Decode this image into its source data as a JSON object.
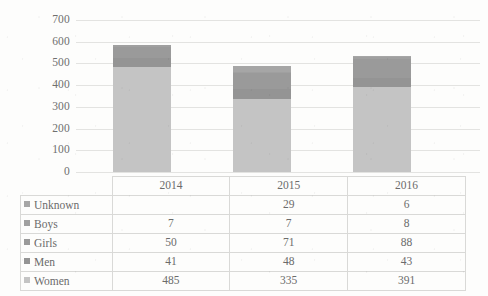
{
  "chart_data": {
    "type": "bar",
    "subtype": "stacked-column",
    "title": "",
    "xlabel": "",
    "ylabel": "",
    "categories": [
      "2014",
      "2015",
      "2016"
    ],
    "series": [
      {
        "name": "Unknown",
        "values": [
          null,
          29,
          6
        ],
        "color": "#a6a6a6"
      },
      {
        "name": "Boys",
        "values": [
          7,
          7,
          8
        ],
        "color": "#a0a0a0"
      },
      {
        "name": "Girls",
        "values": [
          50,
          71,
          88
        ],
        "color": "#9a9a9a"
      },
      {
        "name": "Men",
        "values": [
          41,
          48,
          43
        ],
        "color": "#949494"
      },
      {
        "name": "Women",
        "values": [
          485,
          335,
          391
        ],
        "color": "#c4c4c4"
      }
    ],
    "totals": [
      583,
      490,
      536
    ],
    "ylim": [
      0,
      700
    ],
    "yticks": [
      "0",
      "100",
      "200",
      "300",
      "400",
      "500",
      "600",
      "700"
    ],
    "ytick_values": [
      0,
      100,
      200,
      300,
      400,
      500,
      600,
      700
    ],
    "grid": true,
    "legend": "data-table",
    "data_table_shown": true
  },
  "table": {
    "header": [
      "",
      "2014",
      "2015",
      "2016"
    ],
    "rows": [
      {
        "label": "Unknown",
        "values": [
          "",
          "29",
          "6"
        ]
      },
      {
        "label": "Boys",
        "values": [
          "7",
          "7",
          "8"
        ]
      },
      {
        "label": "Girls",
        "values": [
          "50",
          "71",
          "88"
        ]
      },
      {
        "label": "Men",
        "values": [
          "41",
          "48",
          "43"
        ]
      },
      {
        "label": "Women",
        "values": [
          "485",
          "335",
          "391"
        ]
      }
    ]
  },
  "colors": {
    "background": "#fdfdfc",
    "gridline": "#e3e3e1",
    "tick_text": "#6f6f6f",
    "table_border": "#d9d9d7",
    "bar_women": "#c4c4c4",
    "bar_men": "#949494",
    "bar_girls": "#9a9a9a",
    "bar_boys": "#a0a0a0",
    "bar_unknown": "#a6a6a6"
  }
}
